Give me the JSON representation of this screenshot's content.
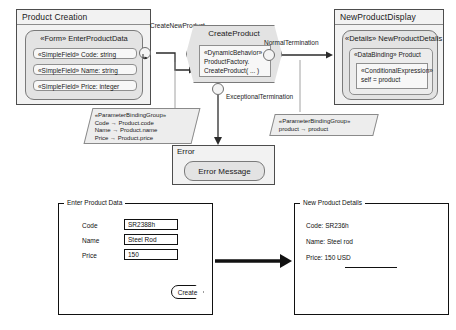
{
  "diagram": {
    "view_containers": [
      {
        "id": "product-creation",
        "title": "Product Creation",
        "component": {
          "header": "«Form» EnterProductData",
          "fields": [
            "«SimpleField» Code: string",
            "«SimpleField» Name: string",
            "«SimpleField» Price: integer"
          ]
        }
      },
      {
        "id": "new-product-display",
        "title": "NewProductDisplay",
        "component": {
          "header": "«Details» NewProductDetails",
          "binding_label": "«DataBinding» Product",
          "expression_line1": "«ConditionalExpression»",
          "expression_line2": "self = product"
        }
      }
    ],
    "action": {
      "title": "CreateProduct",
      "body_line1": "«DynamicBehavior»",
      "body_line2": "ProductFactory.",
      "body_line3": "CreateProduct( ... )"
    },
    "edges": [
      {
        "id": "create-new-product",
        "label": "CreateNewProduct"
      },
      {
        "id": "normal-termination",
        "label": "NormalTermination"
      },
      {
        "id": "exceptional-termination",
        "label": "ExceptionalTermination"
      }
    ],
    "notes": [
      {
        "id": "note-left",
        "lines": [
          "«ParameterBindingGroup»",
          "Code → Product.code",
          "Name → Product.name",
          "Price → Product.price"
        ]
      },
      {
        "id": "note-right",
        "lines": [
          "«ParameterBindingGroup»",
          "product → product"
        ]
      }
    ],
    "error_panel": {
      "title": "Error",
      "message_box": "Error Message"
    }
  },
  "mockups": {
    "left_form": {
      "legend": "Enter Product Data",
      "rows": [
        {
          "label": "Code",
          "value": "SR2388h"
        },
        {
          "label": "Name",
          "value": "Steel Rod"
        },
        {
          "label": "Price",
          "value": "150"
        }
      ],
      "submit_label": "Create"
    },
    "right_panel": {
      "legend": "New Product Details",
      "rows": [
        "Code: SR236h",
        "Name: Steel rod",
        "Price: 150 USD"
      ]
    }
  },
  "colors": {
    "panel_bg": "#f2f2f2",
    "component_bg": "#e3e3e3",
    "field_bg": "#f7f7f7",
    "stroke": "#4d4d4d",
    "ink": "#111111"
  }
}
